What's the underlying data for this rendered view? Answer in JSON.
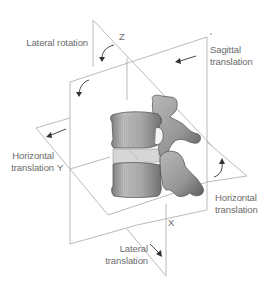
{
  "diagram": {
    "labels": {
      "lateral_rotation": "Lateral rotation",
      "sagittal_translation_1": "Sagittal",
      "sagittal_translation_2": "translation",
      "horizontal_translation_left_1": "Horizontal",
      "horizontal_translation_left_2": "translation",
      "horizontal_translation_right_1": "Horizontal",
      "horizontal_translation_right_2": "translation",
      "lateral_translation_1": "Lateral",
      "lateral_translation_2": "translation"
    },
    "axes": {
      "z": "Z",
      "y": "Y",
      "x": "X"
    },
    "colors": {
      "plane_line": "#a8a8a8",
      "text": "#6b6b6b",
      "arrow": "#333333",
      "bone_light": "#c4c4c4",
      "bone_dark": "#5a5a5a"
    }
  }
}
